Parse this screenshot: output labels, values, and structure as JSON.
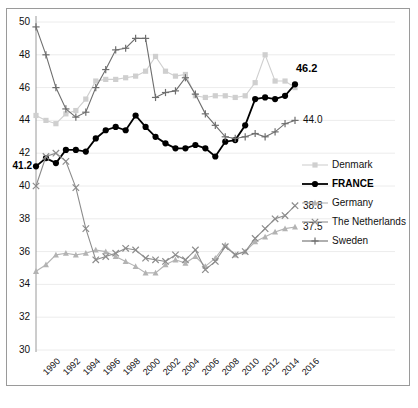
{
  "chart_data": {
    "type": "line",
    "title": "",
    "xlabel": "",
    "ylabel": "",
    "ylim": [
      30,
      50
    ],
    "yticks": [
      30,
      32,
      34,
      36,
      38,
      40,
      42,
      44,
      46,
      48,
      50
    ],
    "grid": true,
    "legend_position": "right",
    "x": [
      1990,
      1991,
      1992,
      1993,
      1994,
      1995,
      1996,
      1997,
      1998,
      1999,
      2000,
      2001,
      2002,
      2003,
      2004,
      2005,
      2006,
      2007,
      2008,
      2009,
      2010,
      2011,
      2012,
      2013,
      2014,
      2015,
      2016
    ],
    "xticks": [
      "1990",
      "1992",
      "1994",
      "1996",
      "1998",
      "2000",
      "2002",
      "2004",
      "2006",
      "2008",
      "2010",
      "2012",
      "2014",
      "2016"
    ],
    "series": [
      {
        "name": "Denmark",
        "marker": "square",
        "color": "#cfcfcf",
        "values": [
          44.3,
          44.0,
          43.8,
          44.4,
          44.6,
          45.3,
          46.4,
          46.5,
          46.5,
          46.6,
          46.7,
          47.0,
          47.9,
          47.0,
          46.7,
          46.8,
          45.5,
          45.4,
          45.5,
          45.5,
          45.4,
          45.5,
          46.3,
          48.0,
          46.4,
          46.4,
          46.0
        ]
      },
      {
        "name": "FRANCE",
        "marker": "circle",
        "color": "#000000",
        "emphasis": true,
        "values": [
          41.2,
          41.7,
          41.4,
          42.2,
          42.2,
          42.1,
          42.9,
          43.4,
          43.6,
          43.4,
          44.3,
          43.6,
          43.0,
          42.6,
          42.3,
          42.3,
          42.5,
          42.3,
          41.8,
          42.7,
          42.8,
          43.7,
          45.3,
          45.4,
          45.3,
          45.5,
          46.2
        ],
        "start_label": "41.2",
        "end_label": "46.2"
      },
      {
        "name": "Germany",
        "marker": "triangle",
        "color": "#b3b3b3",
        "values": [
          34.8,
          35.2,
          35.8,
          35.9,
          35.8,
          35.9,
          36.1,
          36.0,
          35.7,
          35.4,
          35.1,
          34.7,
          34.7,
          35.2,
          35.5,
          35.3,
          35.7,
          35.1,
          35.6,
          36.4,
          35.8,
          36.0,
          36.6,
          36.9,
          37.2,
          37.4,
          37.5
        ],
        "end_label": "37.5"
      },
      {
        "name": "The Netherlands",
        "marker": "cross",
        "color": "#8c8c8c",
        "values": [
          40.0,
          41.8,
          42.0,
          41.5,
          39.9,
          37.4,
          35.5,
          35.7,
          35.9,
          36.2,
          36.1,
          35.6,
          35.5,
          35.4,
          35.8,
          35.5,
          36.1,
          34.9,
          35.4,
          36.3,
          35.8,
          36.0,
          36.8,
          37.4,
          38.0,
          38.2,
          38.8
        ],
        "end_label": "38.8"
      },
      {
        "name": "Sweden",
        "marker": "plus",
        "color": "#6e6e6e",
        "values": [
          49.7,
          48.0,
          46.0,
          44.7,
          44.2,
          44.5,
          46.0,
          47.1,
          48.3,
          48.4,
          49.0,
          49.0,
          45.4,
          45.7,
          45.8,
          46.6,
          45.6,
          44.4,
          43.7,
          43.0,
          42.9,
          43.0,
          43.2,
          43.0,
          43.3,
          43.8,
          44.0
        ],
        "end_label": "44.0"
      }
    ],
    "annotations": [
      {
        "text": "46.2",
        "series": "FRANCE",
        "bold": true
      },
      {
        "text": "46.0",
        "series": "Denmark"
      },
      {
        "text": "44.0",
        "series": "Sweden"
      },
      {
        "text": "38.8",
        "series": "The Netherlands"
      },
      {
        "text": "37.5",
        "series": "Germany"
      },
      {
        "text": "41.2",
        "series": "FRANCE",
        "bold": true
      }
    ]
  },
  "legend": {
    "items": [
      {
        "label": "Denmark"
      },
      {
        "label": "FRANCE"
      },
      {
        "label": "Germany"
      },
      {
        "label": "The Netherlands"
      },
      {
        "label": "Sweden"
      }
    ]
  }
}
